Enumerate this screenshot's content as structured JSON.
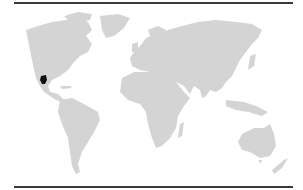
{
  "map": {
    "type": "world-map",
    "projection": "equirectangular-like",
    "land_color": "#d4d4d4",
    "background_color": "#ffffff",
    "rule_color": "#3a3a3a",
    "highlighted_regions": [
      {
        "name": "Northern Mexico",
        "color": "#111111"
      }
    ],
    "continents": [
      "North America",
      "Greenland",
      "South America",
      "Europe",
      "Africa",
      "Asia",
      "Australia",
      "New Zealand",
      "Madagascar"
    ]
  }
}
